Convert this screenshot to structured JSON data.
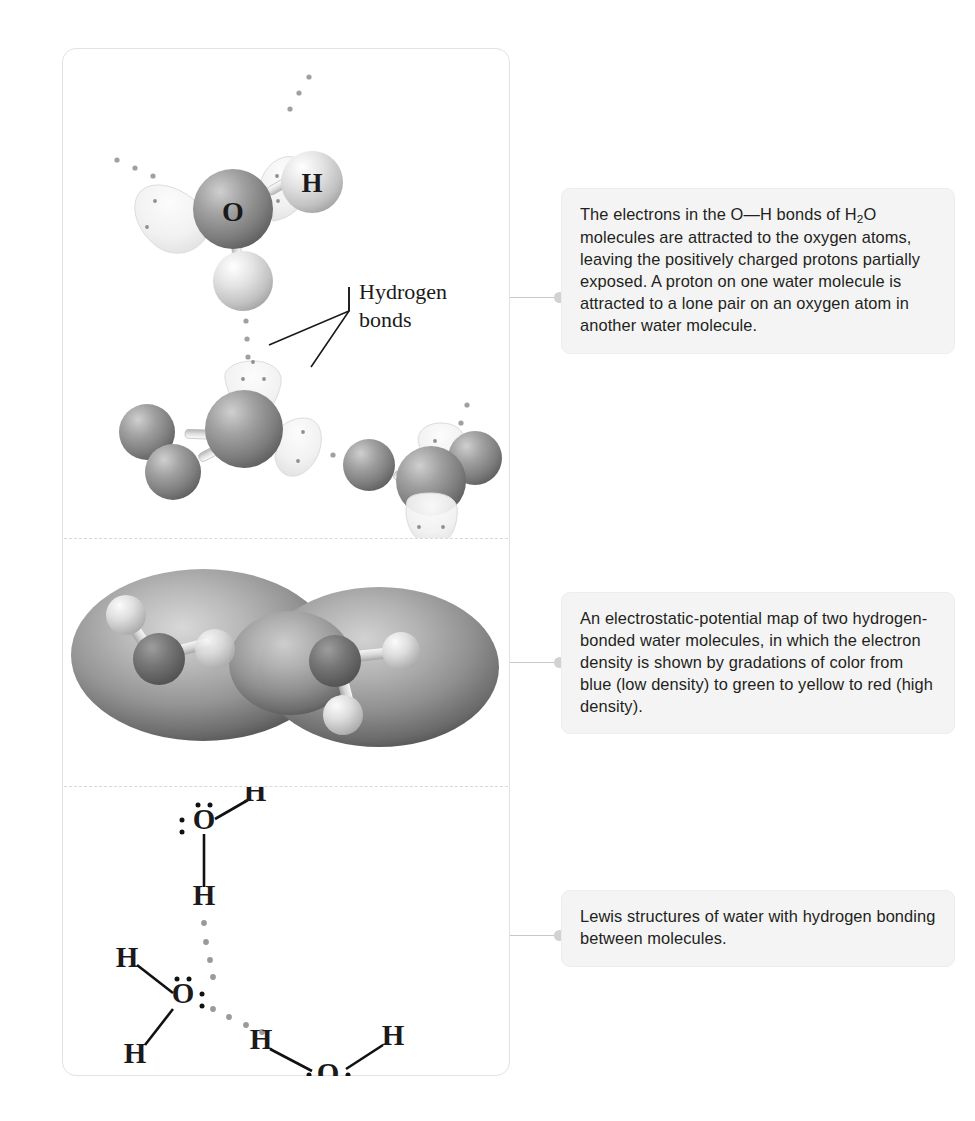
{
  "figure": {
    "panel_label": "hydrogen-bonding-in-water",
    "sections": [
      {
        "id": "ball-stick",
        "name": "ball-and-stick model with lone-pair lobes"
      },
      {
        "id": "esp-map",
        "name": "electrostatic-potential map"
      },
      {
        "id": "lewis",
        "name": "lewis structures"
      }
    ]
  },
  "annotations": {
    "hydrogen_bonds_line1": "Hydrogen",
    "hydrogen_bonds_line2": "bonds"
  },
  "ball_stick": {
    "atom_labels": {
      "oxygen": "O",
      "hydrogen": "H"
    }
  },
  "lewis": {
    "atom_labels": {
      "oxygen": "O",
      "hydrogen": "H"
    },
    "molecule_1": {
      "o": "O",
      "h_upper": "H",
      "h_lower": "H"
    },
    "molecule_2": {
      "o": "O",
      "h_left": "H",
      "h_lower": "H"
    },
    "molecule_3": {
      "o": "O",
      "h_left": "H",
      "h_right": "H"
    }
  },
  "captions": {
    "c1": {
      "part1": "The electrons in the O—H bonds of H",
      "sub1": "2",
      "part2": "O molecules are attracted to the oxygen atoms, leaving the positively charged protons partially exposed. A proton on one water molecule is attracted to a lone pair on an oxygen atom in another water molecule."
    },
    "c2": {
      "text": "An electrostatic-potential map of two hydrogen-bonded water molecules, in which the electron density is shown by gradations of color from blue (low density) to green to yellow to red (high density)."
    },
    "c3": {
      "text": "Lewis structures of water with hydrogen bonding between molecules."
    }
  },
  "colors": {
    "panel_border": "#e2e2e2",
    "divider": "#d8d8d8",
    "caption_bg": "#f4f4f4",
    "caption_border": "#ededed",
    "connector": "#c9c9c9",
    "knob": "#d2d2d2",
    "oxygen_sphere": "#8a8a8a",
    "hydrogen_sphere": "#d5d5d5",
    "lone_pair_lobe": "#f2f2f2",
    "dot": "#9a9a9a",
    "text": "#231f20"
  }
}
